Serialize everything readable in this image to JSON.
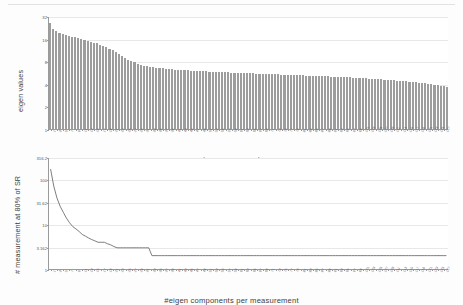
{
  "figures": [
    {
      "id": "eigen-values-bar-chart",
      "ylabel": "eigen values",
      "xlabel": "eigen components"
    },
    {
      "id": "measurements-line-chart",
      "ylabel": "# measurement at 80% of SR",
      "xlabel": "#eigen components per measurement"
    }
  ],
  "chart_data": [
    {
      "type": "bar",
      "title": "",
      "xlabel": "eigen components",
      "ylabel": "eigen values",
      "yscale": "log",
      "ylim": [
        1,
        32
      ],
      "yticks": [
        1,
        2,
        4,
        8,
        16,
        32
      ],
      "ytick_labels": [
        "1",
        "2",
        "4",
        "8",
        "16",
        "32"
      ],
      "grid": true,
      "legend": "none",
      "bar_color": "#9d9d9d",
      "categories": [
        1,
        2,
        3,
        4,
        5,
        6,
        7,
        8,
        9,
        10,
        11,
        12,
        13,
        14,
        15,
        16,
        17,
        18,
        19,
        20,
        21,
        22,
        23,
        24,
        25,
        26,
        27,
        28,
        29,
        30,
        31,
        32,
        33,
        34,
        35,
        36,
        37,
        38,
        39,
        40,
        41,
        42,
        43,
        44,
        45,
        46,
        47,
        48,
        49,
        50,
        51,
        52,
        53,
        54,
        55,
        56,
        57,
        58,
        59,
        60,
        61,
        62,
        63,
        64,
        65,
        66,
        67,
        68,
        69,
        70,
        71,
        72,
        73,
        74,
        75,
        76,
        77,
        78,
        79,
        80,
        81,
        82,
        83,
        84,
        85,
        86,
        87,
        88,
        89,
        90,
        91,
        92,
        93,
        94,
        95,
        96,
        97,
        98,
        99,
        100,
        101,
        102,
        103,
        104,
        105,
        106,
        107,
        108,
        109,
        110,
        111,
        112,
        113,
        114,
        115,
        116,
        117,
        118,
        119,
        120,
        121,
        122,
        123,
        124,
        125,
        126,
        127,
        128
      ],
      "values": [
        25.5,
        21.4,
        20.2,
        19.3,
        18.6,
        18.0,
        17.5,
        17.0,
        16.6,
        16.2,
        15.8,
        15.4,
        15.0,
        14.6,
        14.2,
        13.8,
        13.3,
        12.8,
        12.3,
        11.8,
        11.2,
        10.6,
        10.0,
        9.4,
        8.9,
        8.4,
        8.0,
        7.7,
        7.4,
        7.2,
        7.0,
        6.85,
        6.72,
        6.62,
        6.54,
        6.46,
        6.4,
        6.34,
        6.29,
        6.24,
        6.19,
        6.15,
        6.11,
        6.07,
        6.03,
        6.0,
        5.96,
        5.93,
        5.9,
        5.87,
        5.84,
        5.81,
        5.78,
        5.76,
        5.73,
        5.71,
        5.68,
        5.66,
        5.64,
        5.61,
        5.59,
        5.57,
        5.55,
        5.53,
        5.51,
        5.49,
        5.47,
        5.45,
        5.43,
        5.41,
        5.39,
        5.37,
        5.35,
        5.33,
        5.31,
        5.3,
        5.28,
        5.26,
        5.24,
        5.22,
        5.2,
        5.18,
        5.16,
        5.14,
        5.12,
        5.1,
        5.08,
        5.06,
        5.04,
        5.02,
        5.0,
        4.98,
        4.95,
        4.93,
        4.91,
        4.88,
        4.86,
        4.83,
        4.81,
        4.78,
        4.76,
        4.73,
        4.7,
        4.67,
        4.64,
        4.61,
        4.58,
        4.55,
        4.52,
        4.49,
        4.46,
        4.42,
        4.39,
        4.35,
        4.31,
        4.27,
        4.23,
        4.19,
        4.15,
        4.1,
        4.05,
        4.0,
        3.95,
        3.89,
        3.83,
        3.77,
        3.7,
        3.62
      ]
    },
    {
      "type": "line",
      "title": "",
      "xlabel": "#eigen components per measurement",
      "ylabel": "# measurement at 80% of SR",
      "yscale": "log",
      "ylim": [
        1,
        316.2
      ],
      "yticks": [
        1,
        3.162,
        10,
        31.62,
        100,
        316.2
      ],
      "ytick_labels": [
        "1",
        "3.162",
        "10",
        "31.62",
        "100",
        "316.2"
      ],
      "grid": true,
      "legend": "none",
      "line_color": "#6f6f6f",
      "x": [
        1,
        2,
        3,
        4,
        5,
        6,
        7,
        8,
        9,
        10,
        11,
        12,
        13,
        14,
        15,
        16,
        17,
        18,
        19,
        20,
        21,
        22,
        23,
        24,
        25,
        26,
        27,
        28,
        29,
        30,
        31,
        32,
        33,
        34,
        35,
        36,
        37,
        38,
        39,
        40,
        41,
        42,
        43,
        44,
        45,
        46,
        47,
        48,
        49,
        50,
        51,
        52,
        53,
        54,
        55,
        56,
        57,
        58,
        59,
        60,
        61,
        62,
        63,
        64,
        65,
        66,
        67,
        68,
        69,
        70,
        71,
        72,
        73,
        74,
        75,
        76,
        77,
        78,
        79,
        80,
        81,
        82,
        83,
        84,
        85,
        86,
        87,
        88,
        89,
        90,
        91,
        92,
        93,
        94,
        95,
        96,
        97,
        98,
        99,
        100,
        101,
        102,
        103,
        104,
        105,
        106,
        107,
        108,
        109,
        110,
        111,
        112,
        113,
        114,
        115,
        116,
        117,
        118,
        119,
        120,
        121,
        122,
        123,
        124,
        125,
        126,
        127,
        128
      ],
      "y": [
        178,
        74,
        40,
        26,
        19,
        14,
        11,
        9,
        8,
        7,
        6,
        5.5,
        5,
        4.6,
        4.3,
        4,
        4,
        4,
        3.7,
        3.5,
        3.2,
        3,
        3,
        3,
        3,
        3,
        3,
        3,
        3,
        3,
        3,
        3,
        2,
        2,
        2,
        2,
        2,
        2,
        2,
        2,
        2,
        2,
        2,
        2,
        2,
        2,
        2,
        2,
        2,
        2,
        2,
        2,
        2,
        2,
        2,
        2,
        2,
        2,
        2,
        2,
        2,
        2,
        2,
        2,
        2,
        2,
        2,
        2,
        2,
        2,
        2,
        2,
        2,
        2,
        2,
        2,
        2,
        2,
        2,
        2,
        2,
        2,
        2,
        2,
        2,
        2,
        2,
        2,
        2,
        2,
        2,
        2,
        2,
        2,
        2,
        2,
        2,
        2,
        2,
        2,
        2,
        2,
        2,
        2,
        2,
        2,
        2,
        2,
        2,
        2,
        2,
        2,
        2,
        2,
        2,
        2,
        2,
        2,
        2,
        2,
        2,
        2,
        2,
        2,
        2,
        2
      ]
    }
  ]
}
